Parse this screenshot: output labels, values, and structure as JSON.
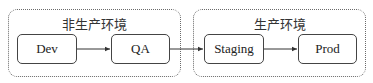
{
  "diagram": {
    "groups": [
      {
        "id": "non-prod",
        "label": "非生产环境"
      },
      {
        "id": "prod",
        "label": "生产环境"
      }
    ],
    "nodes": [
      {
        "id": "dev",
        "label": "Dev",
        "group": "non-prod"
      },
      {
        "id": "qa",
        "label": "QA",
        "group": "non-prod"
      },
      {
        "id": "staging",
        "label": "Staging",
        "group": "prod"
      },
      {
        "id": "prod",
        "label": "Prod",
        "group": "prod"
      }
    ],
    "edges": [
      {
        "from": "dev",
        "to": "qa"
      },
      {
        "from": "qa",
        "to": "staging"
      },
      {
        "from": "staging",
        "to": "prod"
      }
    ],
    "colors": {
      "stroke": "#444444",
      "group_border": "#6a6a6a",
      "background": "#ffffff"
    }
  }
}
